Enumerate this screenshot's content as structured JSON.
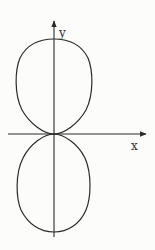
{
  "figure": {
    "axes": {
      "x_label": "x",
      "y_label": "y"
    },
    "colors": {
      "background": "#fcfcfb",
      "stroke": "#2a2a2a",
      "label": "#333333"
    },
    "geometry": {
      "origin": [
        54,
        134
      ],
      "x_axis": {
        "from": 8,
        "to": 147
      },
      "y_axis": {
        "from": 237,
        "to": 20
      },
      "upper_lobe": {
        "top": 39,
        "left": 16,
        "right": 91
      },
      "lower_lobe": {
        "bottom": 232,
        "left": 17,
        "right": 89
      }
    }
  }
}
